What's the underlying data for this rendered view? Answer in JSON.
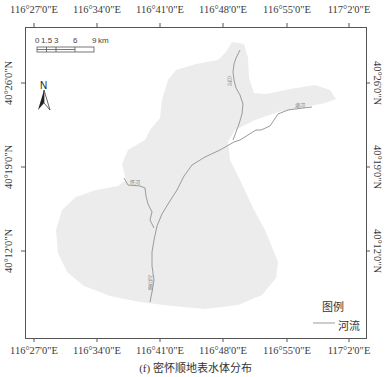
{
  "figure": {
    "caption": "(f) 密怀顺地表水体分布",
    "frame": {
      "left": 25,
      "top": 27,
      "right": 366,
      "bottom": 338
    }
  },
  "axes": {
    "longitude_labels": [
      {
        "label": "116°27'0\"E",
        "x": 34
      },
      {
        "label": "116°34'0\"E",
        "x": 97
      },
      {
        "label": "116°41'0\"E",
        "x": 160
      },
      {
        "label": "116°48'0\"E",
        "x": 223
      },
      {
        "label": "116°55'0\"E",
        "x": 287
      },
      {
        "label": "117°2'0\"E",
        "x": 349
      }
    ],
    "latitude_labels": [
      {
        "label": "40°26'0\"N",
        "y": 83
      },
      {
        "label": "40°19'0\"N",
        "y": 167
      },
      {
        "label": "40°12'0\"N",
        "y": 251
      }
    ]
  },
  "scale_bar": {
    "ticks": [
      "0",
      "1.5",
      "3",
      "6",
      "9"
    ],
    "unit": "km"
  },
  "north_arrow": {
    "label": "N",
    "icon": "north-arrow-icon"
  },
  "legend": {
    "title": "图例",
    "items": [
      {
        "label": "河流",
        "symbol": "line",
        "color": "#9a9a9a"
      }
    ]
  },
  "rivers": [
    {
      "name": "白河"
    },
    {
      "name": "潮河"
    },
    {
      "name": "怀河"
    },
    {
      "name": "潮白河"
    }
  ],
  "colors": {
    "region_fill": "#ececec",
    "river": "#9a9a9a",
    "frame": "#555555",
    "background": "#ffffff"
  }
}
